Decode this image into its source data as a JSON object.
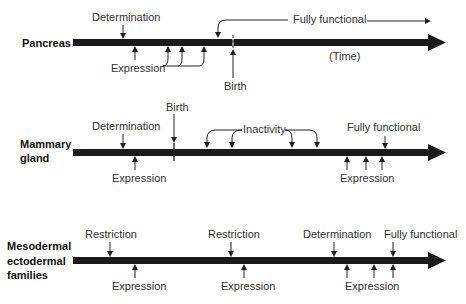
{
  "rows": [
    {
      "title_lines": [
        "Pancreas"
      ],
      "labels": {
        "determination": "Determination",
        "expression": "Expression",
        "birth": "Birth",
        "fully_functional": "Fully functional",
        "time": "(Time)"
      }
    },
    {
      "title_lines": [
        "Mammary",
        "gland"
      ],
      "labels": {
        "birth": "Birth",
        "determination": "Determination",
        "expression_left": "Expression",
        "inactivity": "Inactivity",
        "fully_functional": "Fully functional",
        "expression_right": "Expression"
      }
    },
    {
      "title_lines": [
        "Mesodermal",
        "ectodermal",
        "families"
      ],
      "labels": {
        "restriction_1": "Restriction",
        "expression_1": "Expression",
        "restriction_2": "Restriction",
        "expression_2": "Expression",
        "determination": "Determination",
        "fully_functional": "Fully functional",
        "expression_3": "Expression"
      }
    }
  ],
  "colors": {
    "bar": "#1a1a1a",
    "text": "#333333"
  }
}
